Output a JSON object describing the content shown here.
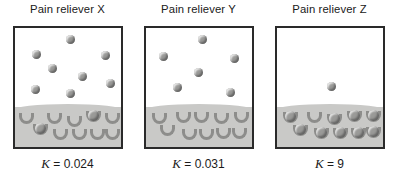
{
  "figure": {
    "name": "pain-reliever-receptor-binding",
    "colors": {
      "molecule": "#9a9a98",
      "membrane": "#c9c9c7",
      "receptor": "#8d8d8b",
      "border": "#2a2a2a",
      "background": "#ffffff",
      "text": "#1b1b1b"
    }
  },
  "panels": [
    {
      "title": "Pain reliever X",
      "k_symbol": "K",
      "k_equals": " = ",
      "k_value": "0.024",
      "k_label": "K = 0.024",
      "free_molecule_count": 8,
      "receptor_count": 10,
      "bound_receptor_count": 2,
      "free_molecules": [
        {
          "x": 51,
          "y": 7
        },
        {
          "x": 17,
          "y": 22
        },
        {
          "x": 86,
          "y": 23
        },
        {
          "x": 33,
          "y": 36
        },
        {
          "x": 63,
          "y": 44
        },
        {
          "x": 91,
          "y": 51
        },
        {
          "x": 16,
          "y": 57
        },
        {
          "x": 51,
          "y": 61
        }
      ],
      "receptors": [
        {
          "x": 4,
          "y": 85,
          "bound": false
        },
        {
          "x": 32,
          "y": 85,
          "bound": false
        },
        {
          "x": 52,
          "y": 88,
          "bound": false
        },
        {
          "x": 71,
          "y": 83,
          "bound": true
        },
        {
          "x": 90,
          "y": 85,
          "bound": false
        },
        {
          "x": 18,
          "y": 96,
          "bound": true
        },
        {
          "x": 38,
          "y": 101,
          "bound": false
        },
        {
          "x": 57,
          "y": 101,
          "bound": false
        },
        {
          "x": 75,
          "y": 101,
          "bound": false
        },
        {
          "x": 90,
          "y": 101,
          "bound": false
        }
      ]
    },
    {
      "title": "Pain reliever Y",
      "k_symbol": "K",
      "k_equals": " = ",
      "k_value": "0.031",
      "k_label": "K = 0.031",
      "free_molecule_count": 6,
      "receptor_count": 10,
      "bound_receptor_count": 0,
      "free_molecules": [
        {
          "x": 52,
          "y": 7
        },
        {
          "x": 13,
          "y": 24
        },
        {
          "x": 84,
          "y": 26
        },
        {
          "x": 48,
          "y": 40
        },
        {
          "x": 27,
          "y": 55
        },
        {
          "x": 80,
          "y": 60
        }
      ],
      "receptors": [
        {
          "x": 6,
          "y": 85,
          "bound": false
        },
        {
          "x": 30,
          "y": 84,
          "bound": false
        },
        {
          "x": 48,
          "y": 84,
          "bound": false
        },
        {
          "x": 68,
          "y": 85,
          "bound": false
        },
        {
          "x": 88,
          "y": 84,
          "bound": false
        },
        {
          "x": 14,
          "y": 97,
          "bound": false
        },
        {
          "x": 36,
          "y": 101,
          "bound": false
        },
        {
          "x": 53,
          "y": 101,
          "bound": false
        },
        {
          "x": 70,
          "y": 100,
          "bound": false
        },
        {
          "x": 86,
          "y": 100,
          "bound": false
        }
      ]
    },
    {
      "title": "Pain reliever Z",
      "k_symbol": "K",
      "k_equals": " = ",
      "k_value": "9",
      "k_label": "K = 9",
      "free_molecule_count": 1,
      "receptor_count": 10,
      "bound_receptor_count": 9,
      "free_molecules": [
        {
          "x": 50,
          "y": 54
        }
      ],
      "receptors": [
        {
          "x": 6,
          "y": 84,
          "bound": true
        },
        {
          "x": 30,
          "y": 84,
          "bound": false
        },
        {
          "x": 50,
          "y": 86,
          "bound": true
        },
        {
          "x": 70,
          "y": 83,
          "bound": true
        },
        {
          "x": 89,
          "y": 83,
          "bound": true
        },
        {
          "x": 16,
          "y": 97,
          "bound": true
        },
        {
          "x": 37,
          "y": 100,
          "bound": true
        },
        {
          "x": 56,
          "y": 100,
          "bound": true
        },
        {
          "x": 74,
          "y": 100,
          "bound": true
        },
        {
          "x": 89,
          "y": 99,
          "bound": true
        }
      ]
    }
  ]
}
